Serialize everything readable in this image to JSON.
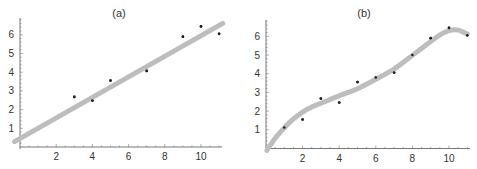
{
  "chart_data": [
    {
      "type": "scatter",
      "title": "(a)",
      "xlabel": "",
      "ylabel": "",
      "xlim": [
        0,
        11.3
      ],
      "ylim": [
        0,
        6.9
      ],
      "grid": false,
      "legend": null,
      "x_ticks": [
        2,
        4,
        6,
        8,
        10
      ],
      "y_ticks": [
        1,
        2,
        3,
        4,
        5,
        6
      ],
      "points": {
        "x": [
          1,
          2,
          3,
          4,
          5,
          6,
          7,
          8,
          9,
          10,
          11
        ],
        "y": [
          1.0,
          1.55,
          2.68,
          2.48,
          3.55,
          3.8,
          4.07,
          4.9,
          5.9,
          6.45,
          6.05
        ]
      },
      "fit": {
        "kind": "linear",
        "intercept": 0.45,
        "slope": 0.55,
        "x_range": [
          -0.3,
          11.2
        ],
        "color": "#bdbdbd"
      }
    },
    {
      "type": "scatter",
      "title": "(b)",
      "xlabel": "",
      "ylabel": "",
      "xlim": [
        0,
        11.3
      ],
      "ylim": [
        0,
        6.9
      ],
      "grid": false,
      "legend": null,
      "x_ticks": [
        2,
        4,
        6,
        8,
        10
      ],
      "y_ticks": [
        1,
        2,
        3,
        4,
        5,
        6
      ],
      "points": {
        "x": [
          1,
          2,
          3,
          4,
          5,
          6,
          7,
          8,
          9,
          10,
          11
        ],
        "y": [
          1.12,
          1.55,
          2.67,
          2.46,
          3.55,
          3.8,
          4.06,
          5.0,
          5.9,
          6.45,
          6.05
        ]
      },
      "fit": {
        "kind": "smooth-curve",
        "curve": [
          [
            0.05,
            -0.1
          ],
          [
            0.5,
            0.55
          ],
          [
            1,
            1.1
          ],
          [
            1.5,
            1.58
          ],
          [
            2,
            1.95
          ],
          [
            2.5,
            2.22
          ],
          [
            3,
            2.42
          ],
          [
            4,
            2.82
          ],
          [
            5,
            3.2
          ],
          [
            6,
            3.7
          ],
          [
            7,
            4.25
          ],
          [
            8,
            4.98
          ],
          [
            9,
            5.72
          ],
          [
            9.5,
            6.08
          ],
          [
            10,
            6.3
          ],
          [
            10.5,
            6.33
          ],
          [
            11,
            6.12
          ]
        ],
        "color": "#bdbdbd"
      }
    }
  ],
  "panels": [
    {
      "title": "(a)",
      "tick_labels_x": [
        "2",
        "4",
        "6",
        "8",
        "10"
      ],
      "tick_labels_y": [
        "1",
        "2",
        "3",
        "4",
        "5",
        "6"
      ]
    },
    {
      "title": "(b)",
      "tick_labels_x": [
        "2",
        "4",
        "6",
        "8",
        "10"
      ],
      "tick_labels_y": [
        "1",
        "2",
        "3",
        "4",
        "5",
        "6"
      ]
    }
  ]
}
